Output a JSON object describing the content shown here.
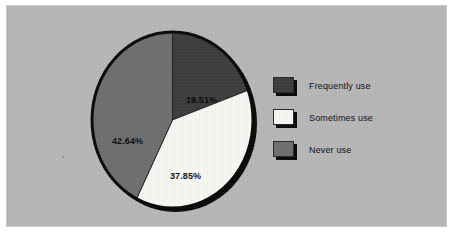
{
  "chart_data": {
    "type": "pie",
    "title": "",
    "categories": [
      "Frequently use",
      "Sometimes use",
      "Never use"
    ],
    "values": [
      19.51,
      37.85,
      42.64
    ],
    "value_labels": [
      "19.51%",
      "37.85%",
      "42.64%"
    ],
    "units": "percent",
    "total": 100.0,
    "start_angle_deg": 0,
    "direction": "clockwise",
    "legend_position": "right",
    "grid": false,
    "colors": [
      "#3d3d3d",
      "#f5f5f2",
      "#6f6f6f"
    ],
    "slices": [
      {
        "label": "Frequently use",
        "value": 19.51,
        "display": "19.51%",
        "color": "#3d3d3d"
      },
      {
        "label": "Sometimes use",
        "value": 37.85,
        "display": "37.85%",
        "color": "#f5f5f2"
      },
      {
        "label": "Never use",
        "value": 42.64,
        "display": "42.64%",
        "color": "#6f6f6f"
      }
    ]
  },
  "legend": {
    "items": [
      {
        "label": "Frequently use",
        "color": "#3d3d3d"
      },
      {
        "label": "Sometimes use",
        "color": "#f5f5f2"
      },
      {
        "label": "Never use",
        "color": "#6f6f6f"
      }
    ]
  },
  "style": {
    "panel_background": "#b6b6b6",
    "page_background": "#ffffff",
    "outline": "#0b0b0b"
  }
}
